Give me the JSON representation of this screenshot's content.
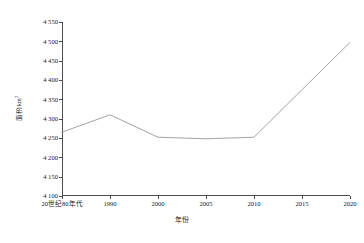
{
  "chart_data": {
    "type": "line",
    "title": "",
    "subtitle": "",
    "xlabel": "年份",
    "ylabel": "面积/km",
    "ylabel_superscript": "2",
    "categories": [
      "20世纪80年代",
      "1990",
      "2000",
      "2005",
      "2010",
      "2015",
      "2020"
    ],
    "values": [
      4265,
      4310,
      4252,
      4248,
      4252,
      4375,
      4497
    ],
    "series": [
      {
        "name": "面积",
        "values": [
          4265,
          4310,
          4252,
          4248,
          4252,
          4375,
          4497
        ]
      }
    ],
    "ylim": [
      4100,
      4550
    ],
    "ytick_step": 50,
    "ytick_labels": [
      "4 550",
      "4 500",
      "4 450",
      "4 400",
      "4 350",
      "4 300",
      "4 250",
      "4 200",
      "4 150",
      "4 100"
    ],
    "ytick_values": [
      4550,
      4500,
      4450,
      4400,
      4350,
      4300,
      4250,
      4200,
      4150,
      4100
    ],
    "grid": false,
    "legend": false,
    "legend_position": "none",
    "line_color": "#8c8c8c",
    "axis_color": "#4d4d4d",
    "background_color": "#ffffff",
    "annotations": []
  }
}
